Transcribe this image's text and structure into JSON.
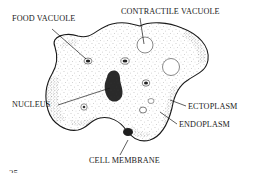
{
  "diagram": {
    "labels": {
      "food_vacuole": "FOOD VACUOLE",
      "contractile_vacuole": "CONTRACTILE VACUOLE",
      "nucleus": "NUCLEUS",
      "ectoplasm": "ECTOPLASM",
      "endoplasm": "ENDOPLASM",
      "cell_membrane": "CELL MEMBRANE"
    },
    "page_number": "25",
    "colors": {
      "ink": "#1a1a1a",
      "background": "#ffffff"
    }
  }
}
